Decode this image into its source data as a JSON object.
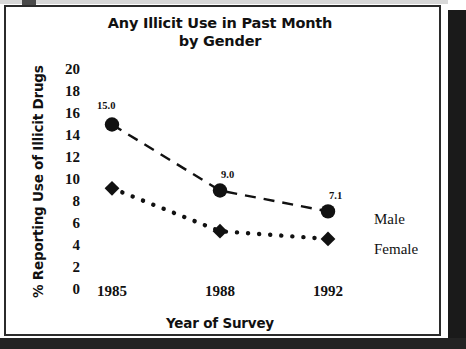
{
  "chart_data": {
    "type": "line",
    "title": "Any Illicit Use in Past Month by Gender",
    "title_line1": "Any Illicit Use in Past Month",
    "title_line2": "by Gender",
    "xlabel": "Year of Survey",
    "ylabel": "% Reporting Use of Illicit Drugs",
    "categories": [
      "1985",
      "1988",
      "1992"
    ],
    "x": [
      1985,
      1988,
      1992
    ],
    "xlim": [
      1984.0,
      1993.2
    ],
    "ylim": [
      0,
      20
    ],
    "ytick_labels": [
      "20",
      "18",
      "16",
      "14",
      "12",
      "10",
      "8",
      "6",
      "4",
      "2",
      "0"
    ],
    "ytick_values": [
      20,
      18,
      16,
      14,
      12,
      10,
      8,
      6,
      4,
      2,
      0
    ],
    "xtick_labels": [
      "1985",
      "1988",
      "1992"
    ],
    "grid": false,
    "axis_lines": false,
    "legend_position": "right-inline",
    "series": [
      {
        "name": "Male",
        "values": [
          15.0,
          9.0,
          7.1
        ],
        "data_labels": [
          "15.0",
          "9.0",
          "7.1"
        ],
        "marker": "circle",
        "line_style": "dashed",
        "color": "#111111"
      },
      {
        "name": "Female",
        "values": [
          9.2,
          5.3,
          4.6
        ],
        "data_labels": [
          "",
          "",
          ""
        ],
        "marker": "diamond",
        "line_style": "dotted",
        "color": "#111111"
      }
    ],
    "annotations": [
      "15.0",
      "9.0",
      "7.1"
    ]
  },
  "legend": {
    "male_label": "Male",
    "female_label": "Female"
  },
  "colors": {
    "ink": "#111111",
    "frame": "#2b2b2b",
    "background": "#ffffff",
    "scan_shadow": "#1a1a1a"
  }
}
